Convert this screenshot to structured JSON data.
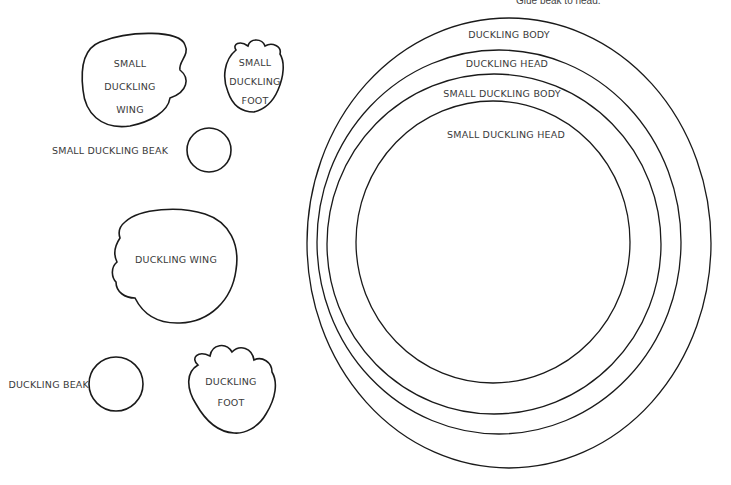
{
  "header": {
    "note": "Glue beak to head."
  },
  "pieces": {
    "small_wing": {
      "line1": "SMALL",
      "line2": "DUCKLING",
      "line3": "WING"
    },
    "small_foot": {
      "line1": "SMALL",
      "line2": "DUCKLING",
      "line3": "FOOT"
    },
    "small_beak": {
      "label": "SMALL DUCKLING BEAK"
    },
    "wing": {
      "label": "DUCKLING WING"
    },
    "beak": {
      "label": "DUCKLING BEAK"
    },
    "foot": {
      "line1": "DUCKLING",
      "line2": "FOOT"
    }
  },
  "rings": [
    {
      "label": "DUCKLING BODY"
    },
    {
      "label": "DUCKLING HEAD"
    },
    {
      "label": "SMALL DUCKLING BODY"
    },
    {
      "label": "SMALL DUCKLING HEAD"
    }
  ],
  "colors": {
    "stroke": "#1a1a1a",
    "text": "#3a3a3a",
    "background": "#ffffff"
  }
}
